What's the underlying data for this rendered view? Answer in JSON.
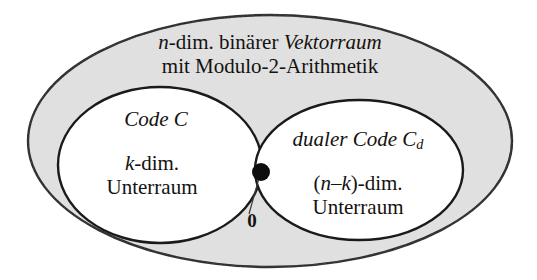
{
  "diagram": {
    "title_universe_line1_part1": "n",
    "title_universe_line1_part2": "-dim. binärer ",
    "title_universe_line1_part3": "Vektorraum",
    "title_universe_line2": "mit Modulo-2-Arithmetik",
    "code_title": "Code C",
    "code_dim_italic": "k",
    "code_dim_rest": "-dim.",
    "code_subspace": "Unterraum",
    "dual_title_text": "dualer Code C",
    "dual_title_sub": "d",
    "dual_dim_open": "(",
    "dual_dim_n": "n",
    "dual_dim_minus": "–",
    "dual_dim_k": "k",
    "dual_dim_close": ")-dim.",
    "dual_subspace": "Unterraum",
    "zero_label": "0",
    "colors": {
      "outline": "#1a1a1a",
      "universe_fill": "#e2e2e2",
      "circle_fill": "#ffffff",
      "point_fill": "#0d0d0d",
      "leader_line": "#3a3a3a",
      "text": "#15120f",
      "background": "#ffffff"
    },
    "geometry": {
      "universe_ellipse": {
        "cx": 270,
        "cy": 141,
        "rx": 242,
        "ry": 126
      },
      "code_ellipse": {
        "cx": 160,
        "cy": 165,
        "rx": 102,
        "ry": 78
      },
      "dual_ellipse": {
        "cx": 359,
        "cy": 170,
        "rx": 104,
        "ry": 70
      },
      "intersection_point": {
        "cx": 261,
        "cy": 172,
        "r": 9
      },
      "leader_line": {
        "x1": 259,
        "y1": 178,
        "x2": 249,
        "y2": 214
      }
    }
  }
}
